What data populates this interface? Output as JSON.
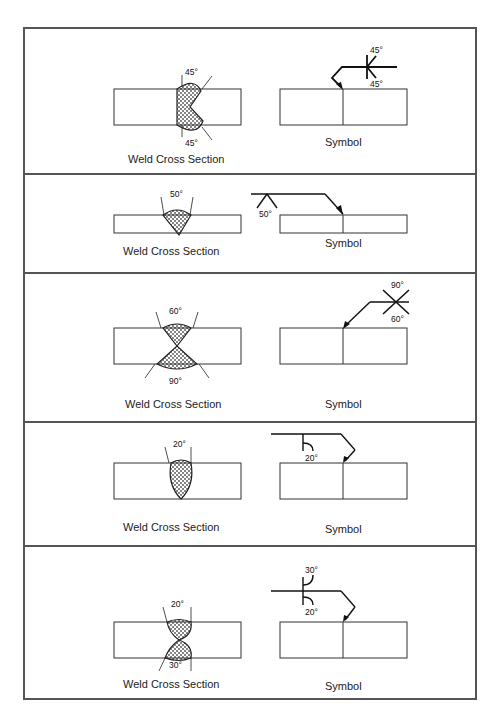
{
  "panels": [
    {
      "cross_section_label": "Weld Cross Section",
      "symbol_label": "Symbol",
      "angles": {
        "top": "45°",
        "bottom": "45°"
      },
      "symbol_angles": {
        "top": "45°",
        "bottom": "45°"
      }
    },
    {
      "cross_section_label": "Weld Cross Section",
      "symbol_label": "Symbol",
      "angles": {
        "top": "50°"
      },
      "symbol_angles": {
        "bottom": "50°"
      }
    },
    {
      "cross_section_label": "Weld Cross Section",
      "symbol_label": "Symbol",
      "angles": {
        "top": "60°",
        "bottom": "90°"
      },
      "symbol_angles": {
        "top": "90°",
        "bottom": "60°"
      }
    },
    {
      "cross_section_label": "Weld Cross Section",
      "symbol_label": "Symbol",
      "angles": {
        "top": "20°"
      },
      "symbol_angles": {
        "bottom": "20°"
      }
    },
    {
      "cross_section_label": "Weld Cross Section",
      "symbol_label": "Symbol",
      "angles": {
        "top": "20°",
        "bottom": "30°"
      },
      "symbol_angles": {
        "top": "30°",
        "bottom": "20°"
      }
    }
  ]
}
